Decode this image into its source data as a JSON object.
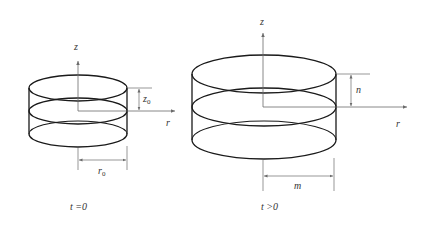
{
  "diagram": {
    "colors": {
      "outline": "#1a1a1a",
      "axis": "#6b6b6b",
      "text": "#333333"
    },
    "left": {
      "axis_z_label": "z",
      "axis_r_label": "r",
      "height_label": "z",
      "height_subscript": "0",
      "radius_label": "r",
      "radius_subscript": "0",
      "caption": "t =0"
    },
    "right": {
      "axis_z_label": "z",
      "axis_r_label": "r",
      "height_label": "n",
      "radius_label": "m",
      "caption": "t >0"
    }
  }
}
